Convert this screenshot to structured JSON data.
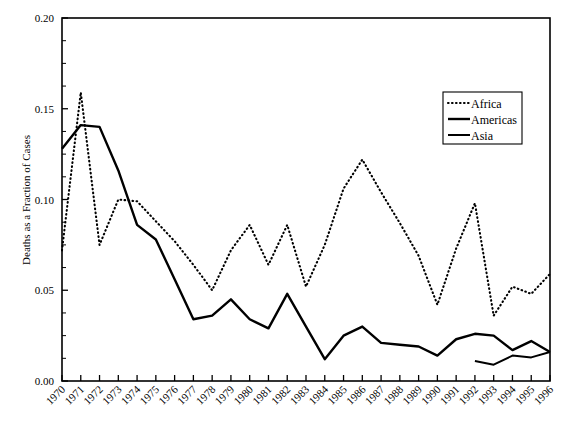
{
  "chart_data": {
    "type": "line",
    "title": "",
    "xlabel": "",
    "ylabel": "Deaths as a Fraction of Cases",
    "xlim": [
      1970,
      1996
    ],
    "ylim": [
      0.0,
      0.2
    ],
    "ytick_labels": [
      "0.00",
      "0.05",
      "0.10",
      "0.15",
      "0.20"
    ],
    "ytick_values": [
      0.0,
      0.05,
      0.1,
      0.15,
      0.2
    ],
    "yminor_step": 0.0125,
    "grid": false,
    "legend_position": "upper right",
    "x": [
      1970,
      1971,
      1972,
      1973,
      1974,
      1975,
      1976,
      1977,
      1978,
      1979,
      1980,
      1981,
      1982,
      1983,
      1984,
      1985,
      1986,
      1987,
      1988,
      1989,
      1990,
      1991,
      1992,
      1993,
      1994,
      1995,
      1996
    ],
    "categories": [
      "1970",
      "1971",
      "1972",
      "1973",
      "1974",
      "1975",
      "1976",
      "1977",
      "1978",
      "1979",
      "1980",
      "1981",
      "1982",
      "1983",
      "1984",
      "1985",
      "1986",
      "1987",
      "1988",
      "1989",
      "1990",
      "1991",
      "1992",
      "1993",
      "1994",
      "1995",
      "1996"
    ],
    "series": [
      {
        "name": "Africa",
        "style": "dotted",
        "color": "#000000",
        "x": [
          1970,
          1971,
          1972,
          1973,
          1974,
          1975,
          1976,
          1977,
          1978,
          1979,
          1980,
          1981,
          1982,
          1983,
          1984,
          1985,
          1986,
          1987,
          1988,
          1989,
          1990,
          1991,
          1992,
          1993,
          1994,
          1995,
          1996
        ],
        "values": [
          0.072,
          0.159,
          0.075,
          0.1,
          0.099,
          0.088,
          0.077,
          0.064,
          0.05,
          0.072,
          0.086,
          0.064,
          0.086,
          0.052,
          0.075,
          0.106,
          0.122,
          0.104,
          0.087,
          0.069,
          0.042,
          0.073,
          0.098,
          0.036,
          0.052,
          0.048,
          0.059
        ]
      },
      {
        "name": "Americas",
        "style": "solid-thick",
        "color": "#000000",
        "x": [
          1970,
          1971,
          1972,
          1973,
          1974,
          1975,
          1976,
          1977,
          1978,
          1979,
          1980,
          1981,
          1982,
          1983,
          1984,
          1985,
          1986,
          1987,
          1988,
          1989,
          1990,
          1991,
          1992,
          1993,
          1994,
          1995,
          1996
        ],
        "values": [
          0.128,
          0.141,
          0.14,
          0.116,
          0.086,
          0.078,
          0.056,
          0.034,
          0.036,
          0.045,
          0.034,
          0.029,
          0.048,
          0.03,
          0.012,
          0.025,
          0.03,
          0.021,
          0.02,
          0.019,
          0.014,
          0.023,
          0.026,
          0.025,
          0.017,
          0.022,
          0.016
        ]
      },
      {
        "name": "Asia",
        "style": "solid-thin",
        "color": "#000000",
        "x": [
          1992,
          1993,
          1994,
          1995,
          1996
        ],
        "values": [
          0.011,
          0.009,
          0.014,
          0.013,
          0.016
        ]
      }
    ]
  },
  "legend": {
    "items": [
      {
        "label": "Africa",
        "style": "dotted"
      },
      {
        "label": "Americas",
        "style": "solid-thick"
      },
      {
        "label": "Asia",
        "style": "solid-thin"
      }
    ]
  }
}
